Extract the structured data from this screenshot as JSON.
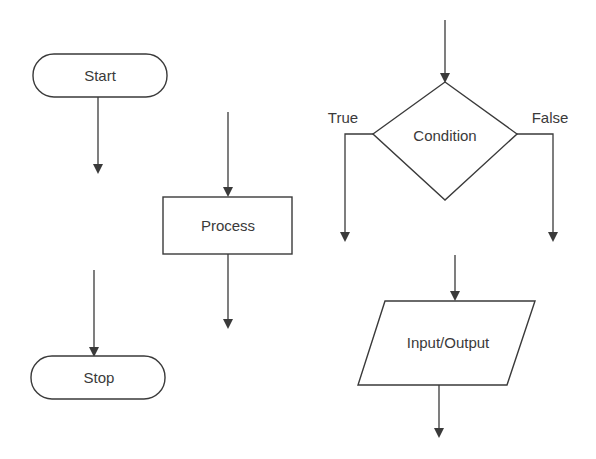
{
  "diagram": {
    "type": "flowchart-symbols",
    "colors": {
      "stroke": "#3a3a3a",
      "background": "#ffffff",
      "text": "#3a3a3a"
    },
    "symbols": {
      "start": {
        "label": "Start",
        "shape": "terminator"
      },
      "stop": {
        "label": "Stop",
        "shape": "terminator"
      },
      "process": {
        "label": "Process",
        "shape": "rectangle"
      },
      "condition": {
        "label": "Condition",
        "shape": "diamond",
        "true_label": "True",
        "false_label": "False"
      },
      "io": {
        "label": "Input/Output",
        "shape": "parallelogram"
      }
    }
  }
}
